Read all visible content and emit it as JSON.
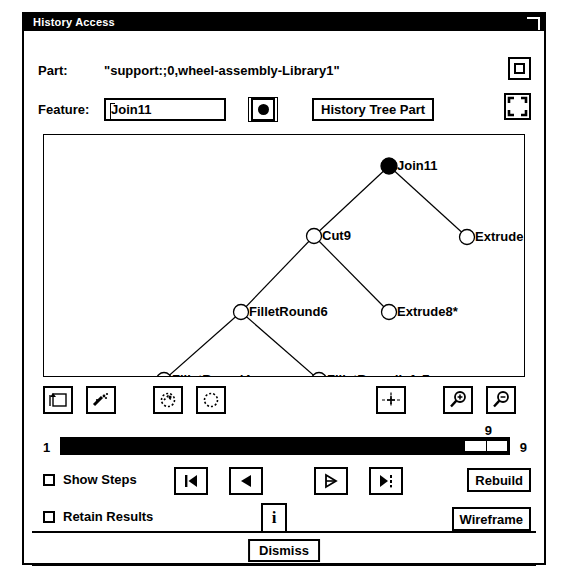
{
  "window": {
    "title": "History Access",
    "resize_corner_icon": "resize-corner-icon"
  },
  "part_row": {
    "label": "Part:",
    "value": "\"support:;0,wheel-assembly-Library1\""
  },
  "feature_row": {
    "label": "Feature:",
    "value": "Join11",
    "placeholder": "Feature name",
    "dot_button_icon": "filled-circle-icon",
    "history_tree_part_label": "History Tree Part"
  },
  "corner_buttons": {
    "maximize_icon": "maximize-square-icon",
    "fit_corners_icon": "fit-corners-icon"
  },
  "tree": {
    "nodes": [
      {
        "id": "join11",
        "label": "Join11",
        "x": 345,
        "y": 31,
        "filled": true
      },
      {
        "id": "cut9",
        "label": "Cut9",
        "x": 270,
        "y": 101,
        "filled": false
      },
      {
        "id": "extrude10",
        "label": "Extrude10*",
        "x": 423,
        "y": 102,
        "filled": false
      },
      {
        "id": "filletround6",
        "label": "FilletRound6",
        "x": 197,
        "y": 177,
        "filled": false
      },
      {
        "id": "extrude8",
        "label": "Extrude8*",
        "x": 345,
        "y": 177,
        "filled": false
      },
      {
        "id": "filletround4",
        "label": "FilletRound4",
        "x": 120,
        "y": 245,
        "filled": false
      },
      {
        "id": "filletroundinfo7",
        "label": "FilletRoundInfo7",
        "x": 275,
        "y": 245,
        "filled": false
      }
    ],
    "edges": [
      [
        "join11",
        "cut9"
      ],
      [
        "join11",
        "extrude10"
      ],
      [
        "cut9",
        "filletround6"
      ],
      [
        "cut9",
        "extrude8"
      ],
      [
        "filletround6",
        "filletround4"
      ],
      [
        "filletround6",
        "filletroundinfo7"
      ]
    ]
  },
  "toolbar": {
    "buttons": [
      {
        "name": "frame-arrow-icon",
        "x": 0
      },
      {
        "name": "sparkle-wand-icon",
        "x": 43
      },
      {
        "name": "dotted-shape-select-icon",
        "x": 110
      },
      {
        "name": "dotted-rect-select-icon",
        "x": 153
      },
      {
        "name": "crosshair-center-icon",
        "x": 333
      },
      {
        "name": "zoom-in-icon",
        "x": 400
      },
      {
        "name": "zoom-out-icon",
        "x": 443
      }
    ]
  },
  "slider": {
    "min_label": "1",
    "max_label": "9",
    "value_label": "9",
    "value": 9,
    "min": 1,
    "max": 9
  },
  "options": {
    "show_steps": {
      "label": "Show Steps",
      "checked": false
    },
    "retain_results": {
      "label": "Retain Results",
      "checked": false
    }
  },
  "step_buttons": [
    {
      "name": "first-step-button",
      "icon": "skip-to-first-icon",
      "x": 150
    },
    {
      "name": "previous-step-button",
      "icon": "step-back-icon",
      "x": 205
    },
    {
      "name": "next-step-button",
      "icon": "step-forward-icon",
      "x": 290
    },
    {
      "name": "last-step-button",
      "icon": "skip-to-last-icon",
      "x": 345
    }
  ],
  "info_button": {
    "name": "info-button",
    "label": "i"
  },
  "action_buttons": {
    "rebuild": "Rebuild",
    "wireframe": "Wireframe"
  },
  "dismiss": {
    "label": "Dismiss"
  }
}
